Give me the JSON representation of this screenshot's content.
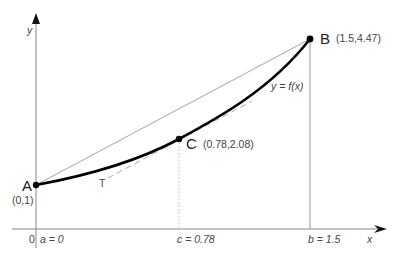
{
  "diagram": {
    "type": "mean-value-theorem-secant-tangent",
    "axes": {
      "x_label": "x",
      "y_label": "y",
      "origin_label": "0"
    },
    "curve_label": "y = f(x)",
    "tangent_label": "T",
    "points": {
      "A": {
        "name": "A",
        "coords": "(0,1)"
      },
      "B": {
        "name": "B",
        "coords": "(1.5,4.47)"
      },
      "C": {
        "name": "C",
        "coords": "(0.78,2.08)"
      }
    },
    "x_ticks": {
      "a": "a = 0",
      "c": "c = 0.78",
      "b": "b = 1.5"
    },
    "colors": {
      "curve": "#000000",
      "axis": "#888888",
      "secant": "#999999",
      "tangent": "#aaaaaa"
    }
  }
}
